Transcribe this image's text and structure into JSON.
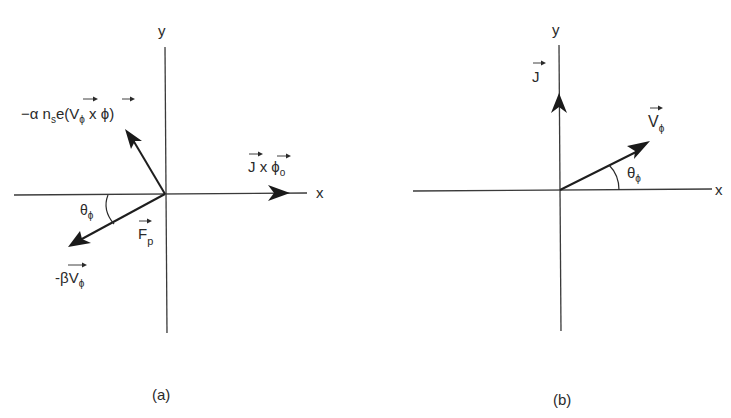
{
  "panel_a": {
    "caption": "(a)",
    "axis_x_label": "x",
    "axis_y_label": "y",
    "vector_up_left_label": {
      "prefix": "−α n",
      "sub_s": "s",
      "mid": "e(",
      "V": "V",
      "sub_phi": "ϕ",
      "cross": " x ",
      "phi": "ϕ",
      "close": ")"
    },
    "vector_x_label": {
      "J": "J",
      "cross": " x ",
      "phi": "ϕ",
      "sub_o": "o"
    },
    "angle_label": {
      "theta": "θ",
      "sub_phi": "ϕ"
    },
    "force_label": {
      "F": "F",
      "sub_p": "p"
    },
    "vector_down_left_label": {
      "prefix": "-β",
      "V": "V",
      "sub_phi": "ϕ"
    }
  },
  "panel_b": {
    "caption": "(b)",
    "axis_x_label": "x",
    "axis_y_label": "y",
    "current_label": {
      "J": "J"
    },
    "velocity_label": {
      "V": "V",
      "sub_phi": "ϕ"
    },
    "angle_label": {
      "theta": "θ",
      "sub_phi": "ϕ"
    }
  }
}
